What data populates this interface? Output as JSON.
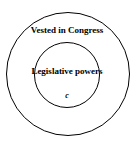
{
  "diagram": {
    "type": "nested-circles",
    "outer_circle": {
      "label": "Vested in Congress"
    },
    "inner_circle": {
      "label": "Legislative powers",
      "sublabel": "c"
    },
    "colors": {
      "stroke": "#000000",
      "background": "#ffffff",
      "text": "#000000"
    }
  }
}
